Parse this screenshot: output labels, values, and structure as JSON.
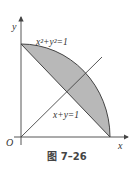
{
  "figure": {
    "caption": "图 7–26",
    "labels": {
      "y_axis": "y",
      "x_axis": "x",
      "origin": "O",
      "circle_eq": "x²+y²=1",
      "line_eq": "x+y=1"
    },
    "colors": {
      "fill": "#b8b8b8",
      "stroke": "#444444"
    }
  }
}
